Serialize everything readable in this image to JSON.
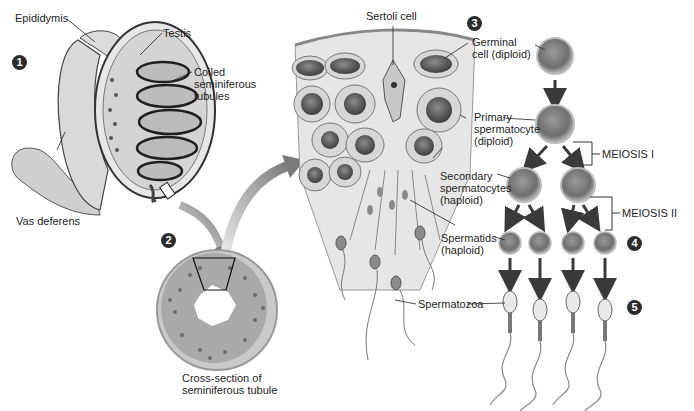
{
  "diagram": {
    "steps": [
      {
        "number": "1",
        "x": 12,
        "y": 55
      },
      {
        "number": "2",
        "x": 161,
        "y": 233
      },
      {
        "number": "3",
        "x": 467,
        "y": 16
      },
      {
        "number": "4",
        "x": 627,
        "y": 236
      },
      {
        "number": "5",
        "x": 627,
        "y": 300
      }
    ],
    "labels": {
      "epididymis": "Epididymis",
      "testis": "Testis",
      "coiled_tubules": "Coiled\nseminiferous\ntubules",
      "vas_deferens": "Vas deferens",
      "cross_section": "Cross-section of\nseminiferous tubule",
      "sertoli_cell": "Sertoli cell",
      "germinal_cell": "Germinal\ncell (diploid)",
      "primary_spermatocyte": "Primary\nspermatocyte\n(diploid)",
      "meiosis_1": "MEIOSIS I",
      "secondary_spermatocytes": "Secondary\nspermatocytes\n(haploid)",
      "meiosis_2": "MEIOSIS II",
      "spermatids": "Spermatids\n(haploid)",
      "spermatozoa": "Spermatozoa"
    },
    "colors": {
      "ink": "#1e1e1e",
      "cell_fill": "#8a8a8a",
      "cell_rim": "#c8c8c8",
      "arrow": "#3a3a3a",
      "tissue": "#e2e2e2",
      "step_badge": "#2c2c2c"
    }
  }
}
